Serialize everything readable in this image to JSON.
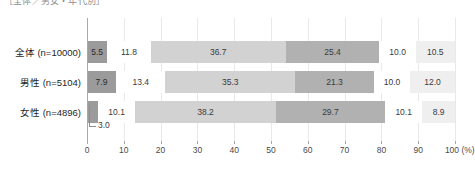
{
  "title": "［全体／男女・年代別］",
  "axis": {
    "ticks": [
      0,
      10,
      20,
      30,
      40,
      50,
      60,
      70,
      80,
      90,
      100
    ],
    "unit": "(%)",
    "max": 100,
    "min": 0
  },
  "callout": {
    "value": "3.0"
  },
  "colors": {
    "seg1": "#9b9b9b",
    "seg2": "#ffffff",
    "seg3": "#d2d2d2",
    "seg4": "#b1b1b1",
    "seg5": "#ffffff",
    "seg6": "#efefef",
    "gridline": "#e9e9e9",
    "axis": "#a8a8a8",
    "text": "#3a3a3a"
  },
  "chart_data": {
    "type": "bar",
    "title": "［全体／男女・年代別］",
    "xlabel": "(%)",
    "ylabel": "",
    "xlim": [
      0,
      100
    ],
    "grid": true,
    "legend_position": "none",
    "stacked": true,
    "orientation": "horizontal",
    "categories": [
      "全体 (n=10000)",
      "男性 (n=5104)",
      "女性 (n=4896)"
    ],
    "series": [
      {
        "name": "seg1",
        "values": [
          5.5,
          7.9,
          3.0
        ]
      },
      {
        "name": "seg2",
        "values": [
          11.8,
          13.4,
          10.1
        ]
      },
      {
        "name": "seg3",
        "values": [
          36.7,
          35.3,
          38.2
        ]
      },
      {
        "name": "seg4",
        "values": [
          25.4,
          21.3,
          29.7
        ]
      },
      {
        "name": "seg5",
        "values": [
          10.0,
          10.0,
          10.1
        ]
      },
      {
        "name": "seg6",
        "values": [
          10.5,
          12.0,
          8.9
        ]
      }
    ],
    "rows": [
      {
        "label": "全体 (n=10000)",
        "values": [
          5.5,
          11.8,
          36.7,
          25.4,
          10.0,
          10.5
        ],
        "labels": [
          "5.5",
          "11.8",
          "36.7",
          "25.4",
          "10.0",
          "10.5"
        ]
      },
      {
        "label": "男性 (n=5104)",
        "values": [
          7.9,
          13.4,
          35.3,
          21.3,
          10.0,
          12.0
        ],
        "labels": [
          "7.9",
          "13.4",
          "35.3",
          "21.3",
          "10.0",
          "12.0"
        ]
      },
      {
        "label": "女性 (n=4896)",
        "values": [
          3.0,
          10.1,
          38.2,
          29.7,
          10.1,
          8.9
        ],
        "labels": [
          "3.0",
          "10.1",
          "38.2",
          "29.7",
          "10.1",
          "8.9"
        ]
      }
    ]
  }
}
